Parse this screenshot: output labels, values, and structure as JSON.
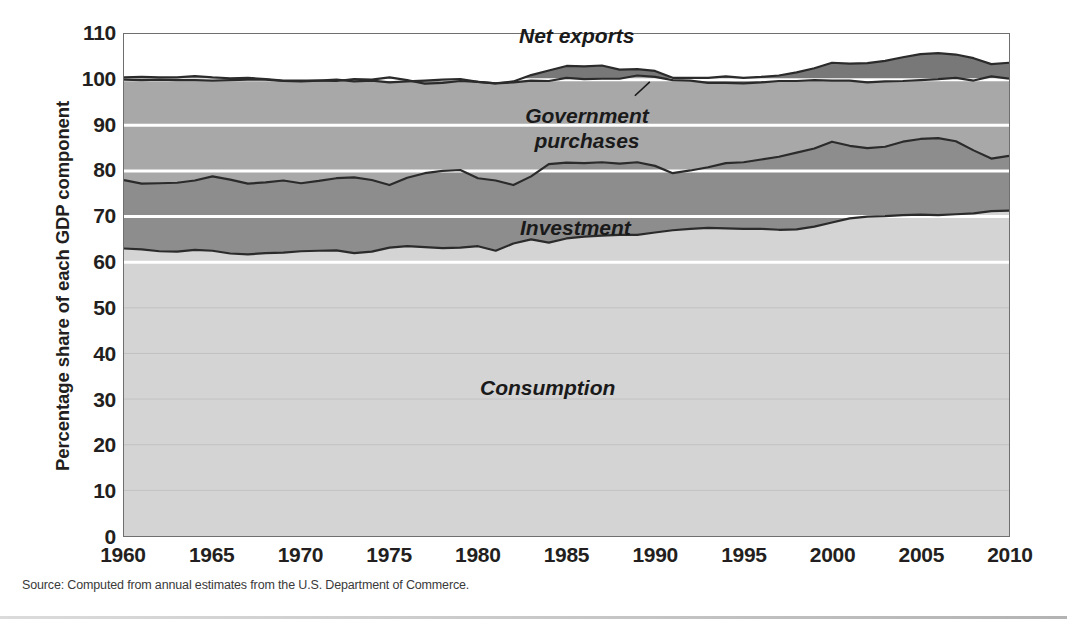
{
  "figure": {
    "source_note": "Source: Computed from annual estimates from the U.S. Department of Commerce.",
    "colors": {
      "consumption": "#d4d4d4",
      "investment": "#8d8d8d",
      "government": "#a8a8a8",
      "net_exports": "#787878",
      "plot_border": "#6f6f6f",
      "series_line": "#2b2b2b",
      "gridline": "#ffffff",
      "text": "#231f20"
    }
  },
  "chart_data": {
    "type": "area",
    "stacked": true,
    "title": "",
    "xlabel": "",
    "ylabel": "Percentage share of each GDP component",
    "xlim": [
      1960,
      2010
    ],
    "ylim": [
      0,
      110
    ],
    "ytick_step": 10,
    "yticks": [
      0,
      10,
      20,
      30,
      40,
      50,
      60,
      70,
      80,
      90,
      100,
      110
    ],
    "xticks": [
      1960,
      1965,
      1970,
      1975,
      1980,
      1985,
      1990,
      1995,
      2000,
      2005,
      2010
    ],
    "grid": "horizontal-white-major",
    "legend": "inline-labels",
    "annotations": [
      {
        "text": "Net exports",
        "series": "Net exports",
        "has_leader_line": true
      },
      {
        "text": "Government\npurchases",
        "series": "Government purchases",
        "has_leader_line": false
      },
      {
        "text": "Investment",
        "series": "Investment",
        "has_leader_line": false
      },
      {
        "text": "Consumption",
        "series": "Consumption",
        "has_leader_line": false
      }
    ],
    "x": [
      1960,
      1961,
      1962,
      1963,
      1964,
      1965,
      1966,
      1967,
      1968,
      1969,
      1970,
      1971,
      1972,
      1973,
      1974,
      1975,
      1976,
      1977,
      1978,
      1979,
      1980,
      1981,
      1982,
      1983,
      1984,
      1985,
      1986,
      1987,
      1988,
      1989,
      1990,
      1991,
      1992,
      1993,
      1994,
      1995,
      1996,
      1997,
      1998,
      1999,
      2000,
      2001,
      2002,
      2003,
      2004,
      2005,
      2006,
      2007,
      2008,
      2009,
      2010
    ],
    "series": [
      {
        "name": "Consumption",
        "color": "#d4d4d4",
        "values": [
          63.0,
          62.8,
          62.4,
          62.3,
          62.7,
          62.5,
          61.9,
          61.7,
          62.0,
          62.1,
          62.4,
          62.5,
          62.6,
          62.0,
          62.3,
          63.2,
          63.5,
          63.3,
          63.1,
          63.2,
          63.5,
          62.5,
          64.1,
          65.0,
          64.3,
          65.2,
          65.6,
          65.8,
          66.0,
          66.0,
          66.5,
          67.0,
          67.3,
          67.5,
          67.4,
          67.3,
          67.3,
          67.1,
          67.2,
          67.8,
          68.7,
          69.6,
          70.0,
          70.1,
          70.3,
          70.4,
          70.3,
          70.5,
          70.7,
          71.2,
          71.3
        ]
      },
      {
        "name": "Investment",
        "color": "#8d8d8d",
        "values": [
          15.0,
          14.4,
          14.9,
          15.1,
          15.2,
          16.3,
          16.2,
          15.5,
          15.5,
          15.8,
          14.9,
          15.3,
          15.8,
          16.6,
          15.7,
          13.7,
          15.0,
          16.2,
          16.9,
          17.0,
          14.9,
          15.4,
          12.8,
          13.8,
          17.2,
          16.6,
          16.1,
          16.1,
          15.6,
          15.9,
          14.6,
          12.5,
          12.8,
          13.3,
          14.3,
          14.6,
          15.2,
          16.0,
          16.8,
          17.1,
          17.7,
          15.9,
          15.0,
          15.2,
          16.1,
          16.6,
          16.9,
          16.0,
          13.8,
          11.5,
          12.0
        ]
      },
      {
        "name": "Government purchases",
        "color": "#a8a8a8",
        "values": [
          22.0,
          22.7,
          22.7,
          22.5,
          22.0,
          21.0,
          21.8,
          22.8,
          22.5,
          21.8,
          22.3,
          22.0,
          21.6,
          21.0,
          21.8,
          22.5,
          21.1,
          20.3,
          20.0,
          19.9,
          21.1,
          21.3,
          22.7,
          22.2,
          20.5,
          21.2,
          21.2,
          21.2,
          20.6,
          20.4,
          20.8,
          20.9,
          20.3,
          19.6,
          19.0,
          18.5,
          18.1,
          17.8,
          17.6,
          17.6,
          17.3,
          18.0,
          18.6,
          18.8,
          18.5,
          18.6,
          18.6,
          19.0,
          20.2,
          20.7,
          20.4
        ]
      },
      {
        "name": "Net exports",
        "color": "#787878",
        "values": [
          0.5,
          0.7,
          0.5,
          0.6,
          0.9,
          0.7,
          0.4,
          0.4,
          0.1,
          0.1,
          0.2,
          0.0,
          -0.3,
          0.5,
          0.2,
          1.1,
          0.3,
          -0.7,
          -0.7,
          -0.4,
          0.0,
          0.0,
          -0.2,
          -1.2,
          -2.3,
          -2.6,
          -2.8,
          -2.9,
          -2.0,
          -1.4,
          -1.3,
          -0.5,
          -0.6,
          -1.1,
          -1.4,
          -1.2,
          -1.2,
          -1.2,
          -1.9,
          -2.6,
          -3.9,
          -3.7,
          -4.2,
          -4.5,
          -5.2,
          -5.7,
          -5.7,
          -5.1,
          -4.9,
          -2.7,
          -3.5
        ]
      }
    ],
    "series_order_bottom_to_top": [
      "Consumption",
      "Investment",
      "Government purchases",
      "Net exports"
    ]
  },
  "yticks": [
    {
      "label": "110",
      "value": 110
    },
    {
      "label": "100",
      "value": 100
    },
    {
      "label": "90",
      "value": 90
    },
    {
      "label": "80",
      "value": 80
    },
    {
      "label": "70",
      "value": 70
    },
    {
      "label": "60",
      "value": 60
    },
    {
      "label": "50",
      "value": 50
    },
    {
      "label": "40",
      "value": 40
    },
    {
      "label": "30",
      "value": 30
    },
    {
      "label": "20",
      "value": 20
    },
    {
      "label": "10",
      "value": 10
    },
    {
      "label": "0",
      "value": 0
    }
  ],
  "xticks": [
    {
      "label": "1960",
      "value": 1960
    },
    {
      "label": "1965",
      "value": 1965
    },
    {
      "label": "1970",
      "value": 1970
    },
    {
      "label": "1975",
      "value": 1975
    },
    {
      "label": "1980",
      "value": 1980
    },
    {
      "label": "1985",
      "value": 1985
    },
    {
      "label": "1990",
      "value": 1990
    },
    {
      "label": "1995",
      "value": 1995
    },
    {
      "label": "2000",
      "value": 2000
    },
    {
      "label": "2005",
      "value": 2005
    },
    {
      "label": "2010",
      "value": 2010
    }
  ],
  "labels": {
    "net_exports": "Net exports",
    "government_line1": "Government",
    "government_line2": "purchases",
    "investment": "Investment",
    "consumption": "Consumption"
  }
}
